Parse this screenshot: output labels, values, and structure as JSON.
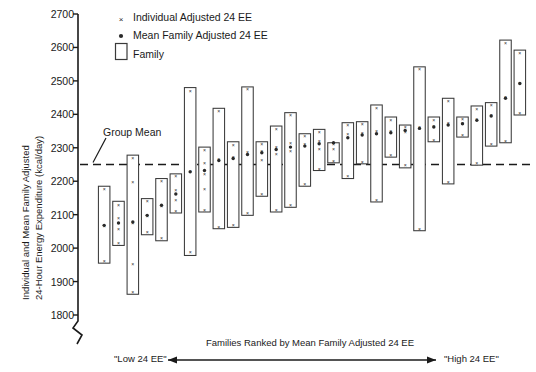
{
  "chart_data": {
    "type": "bar",
    "title": "",
    "subtitle": "",
    "ylabel": "Individual and Mean Family Adjusted 24-Hour Energy Expenditure (kcal/day)",
    "ylabel_line1": "Individual and Mean Family Adjusted",
    "ylabel_line2": "24-Hour Energy Expenditure (kcal/day)",
    "xlabel": "Families Ranked by Mean Family Adjusted 24 EE",
    "xlabel_left_end": "\"Low 24 EE\"",
    "xlabel_right_end": "\"High 24 EE\"",
    "ylim": [
      1800,
      2700
    ],
    "yticks": [
      1800,
      1900,
      2000,
      2100,
      2200,
      2300,
      2400,
      2500,
      2600,
      2700
    ],
    "ytick_labels": [
      "1800",
      "1900",
      "2000",
      "2100",
      "2200",
      "2300",
      "2400",
      "2500",
      "2600",
      "2700"
    ],
    "y_axis_broken_below": 1800,
    "grid": false,
    "legend_position": "top-left-inside",
    "legend": [
      {
        "marker": "x",
        "label": "Individual Adjusted 24 EE"
      },
      {
        "marker": "dot",
        "label": "Mean Family Adjusted 24 EE"
      },
      {
        "marker": "box",
        "label": "Family"
      }
    ],
    "annotations": [
      {
        "text": "Group Mean",
        "value": 2250,
        "style": "dashed-horizontal-line-with-leader"
      }
    ],
    "group_mean": 2250,
    "units": "kcal/day",
    "n_families": 30,
    "series_description": "Each open rectangle spans the range of individual adjusted 24-h EE within one family; x marks are individual members; the filled dot is the mean family adjusted 24 EE. Families are sorted left-to-right by increasing family mean.",
    "families": [
      {
        "rank": 1,
        "box_low": 1955,
        "box_high": 2185,
        "mean": 2068,
        "individuals": [
          2178,
          2068,
          1962
        ]
      },
      {
        "rank": 2,
        "box_low": 2008,
        "box_high": 2140,
        "mean": 2075,
        "individuals": [
          2131,
          2092,
          2058,
          2017
        ]
      },
      {
        "rank": 3,
        "box_low": 1862,
        "box_high": 2278,
        "mean": 2078,
        "individuals": [
          2270,
          2198,
          2075,
          1952,
          1870
        ]
      },
      {
        "rank": 4,
        "box_low": 2040,
        "box_high": 2148,
        "mean": 2098,
        "individuals": [
          2140,
          2098,
          2048
        ]
      },
      {
        "rank": 5,
        "box_low": 2022,
        "box_high": 2208,
        "mean": 2128,
        "individuals": [
          2200,
          2128,
          2030
        ]
      },
      {
        "rank": 6,
        "box_low": 2105,
        "box_high": 2222,
        "mean": 2162,
        "individuals": [
          2215,
          2175,
          2145,
          2112
        ]
      },
      {
        "rank": 7,
        "box_low": 1978,
        "box_high": 2480,
        "mean": 2228,
        "individuals": [
          2470,
          2232,
          1988
        ]
      },
      {
        "rank": 8,
        "box_low": 2108,
        "box_high": 2302,
        "mean": 2232,
        "individuals": [
          2295,
          2255,
          2222,
          2178,
          2115
        ]
      },
      {
        "rank": 9,
        "box_low": 2058,
        "box_high": 2418,
        "mean": 2262,
        "individuals": [
          2410,
          2268,
          2065
        ]
      },
      {
        "rank": 10,
        "box_low": 2062,
        "box_high": 2318,
        "mean": 2268,
        "individuals": [
          2310,
          2272,
          2070
        ]
      },
      {
        "rank": 11,
        "box_low": 2098,
        "box_high": 2482,
        "mean": 2280,
        "individuals": [
          2475,
          2288,
          2105
        ]
      },
      {
        "rank": 12,
        "box_low": 2155,
        "box_high": 2318,
        "mean": 2285,
        "individuals": [
          2312,
          2292,
          2265,
          2162
        ]
      },
      {
        "rank": 13,
        "box_low": 2108,
        "box_high": 2365,
        "mean": 2295,
        "individuals": [
          2358,
          2302,
          2282,
          2115
        ]
      },
      {
        "rank": 14,
        "box_low": 2122,
        "box_high": 2405,
        "mean": 2302,
        "individuals": [
          2398,
          2315,
          2290,
          2130
        ]
      },
      {
        "rank": 15,
        "box_low": 2185,
        "box_high": 2342,
        "mean": 2305,
        "individuals": [
          2335,
          2312,
          2192
        ]
      },
      {
        "rank": 16,
        "box_low": 2232,
        "box_high": 2355,
        "mean": 2312,
        "individuals": [
          2348,
          2322,
          2298,
          2238
        ]
      },
      {
        "rank": 17,
        "box_low": 2255,
        "box_high": 2315,
        "mean": 2315,
        "individuals": [
          2312,
          2298,
          2262
        ]
      },
      {
        "rank": 18,
        "box_low": 2208,
        "box_high": 2375,
        "mean": 2330,
        "individuals": [
          2368,
          2342,
          2215
        ]
      },
      {
        "rank": 19,
        "box_low": 2252,
        "box_high": 2378,
        "mean": 2338,
        "individuals": [
          2372,
          2345,
          2258
        ]
      },
      {
        "rank": 20,
        "box_low": 2138,
        "box_high": 2428,
        "mean": 2342,
        "individuals": [
          2420,
          2352,
          2145
        ]
      },
      {
        "rank": 21,
        "box_low": 2272,
        "box_high": 2392,
        "mean": 2345,
        "individuals": [
          2385,
          2352,
          2278
        ]
      },
      {
        "rank": 22,
        "box_low": 2240,
        "box_high": 2368,
        "mean": 2352,
        "individuals": [
          2362,
          2348,
          2248
        ]
      },
      {
        "rank": 23,
        "box_low": 2052,
        "box_high": 2542,
        "mean": 2358,
        "individuals": [
          2535,
          2362,
          2058
        ]
      },
      {
        "rank": 24,
        "box_low": 2318,
        "box_high": 2392,
        "mean": 2362,
        "individuals": [
          2385,
          2365,
          2325
        ]
      },
      {
        "rank": 25,
        "box_low": 2192,
        "box_high": 2448,
        "mean": 2368,
        "individuals": [
          2440,
          2375,
          2198
        ]
      },
      {
        "rank": 26,
        "box_low": 2332,
        "box_high": 2392,
        "mean": 2372,
        "individuals": [
          2388,
          2375,
          2338
        ]
      },
      {
        "rank": 27,
        "box_low": 2248,
        "box_high": 2425,
        "mean": 2382,
        "individuals": [
          2418,
          2388,
          2255
        ]
      },
      {
        "rank": 28,
        "box_low": 2305,
        "box_high": 2435,
        "mean": 2395,
        "individuals": [
          2428,
          2400,
          2312
        ]
      },
      {
        "rank": 29,
        "box_low": 2315,
        "box_high": 2622,
        "mean": 2448,
        "individuals": [
          2615,
          2452,
          2322
        ]
      },
      {
        "rank": 30,
        "box_low": 2398,
        "box_high": 2592,
        "mean": 2492,
        "individuals": [
          2585,
          2495,
          2405
        ]
      }
    ]
  },
  "colors": {
    "axis": "#1a1a1a",
    "box_stroke": "#3a3a3a",
    "marker": "#2a2a2a",
    "mean_line": "#1a1a1a",
    "background": "#ffffff"
  }
}
